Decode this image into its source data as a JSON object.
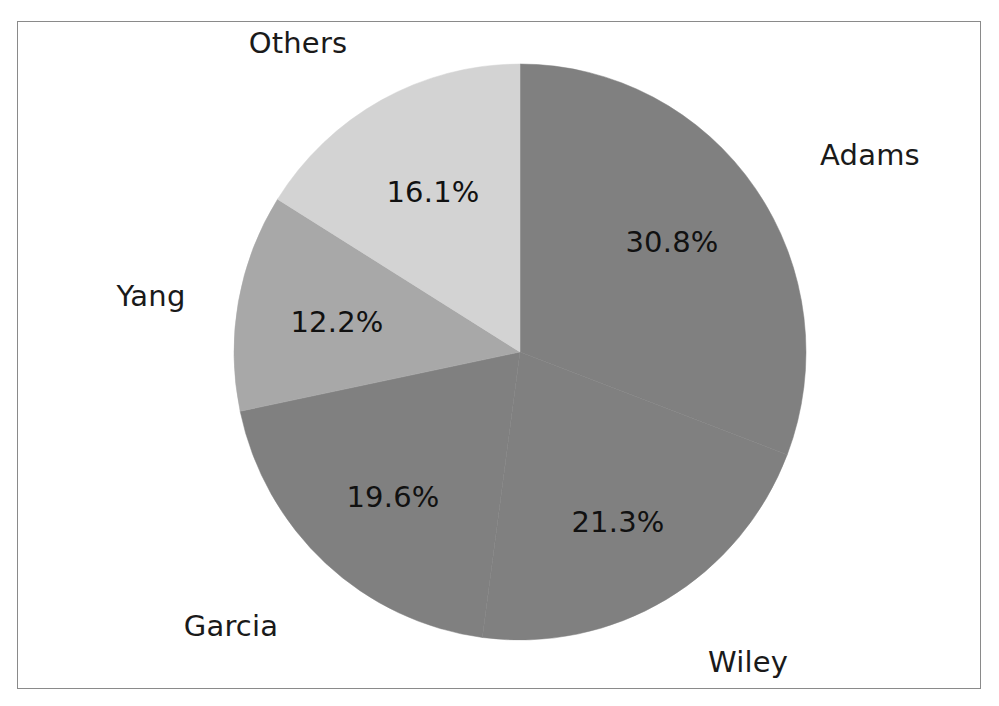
{
  "figure": {
    "background_color": "#ffffff",
    "frame_color": "#8a8a8a",
    "label_color": "#1a1a1a"
  },
  "chart_data": {
    "type": "pie",
    "title": "",
    "xlabel": "",
    "ylabel": "",
    "legend_position": "none",
    "grid": false,
    "start_angle_deg": 90,
    "direction": "clockwise",
    "autopct_format": "%.1f%%",
    "categories": [
      "Adams",
      "Wiley",
      "Garcia",
      "Yang",
      "Others"
    ],
    "values": [
      30.8,
      21.3,
      19.6,
      12.2,
      16.1
    ],
    "labels": [
      "30.8%",
      "21.3%",
      "19.6%",
      "12.2%",
      "16.1%"
    ],
    "colors": [
      "#808080",
      "#808080",
      "#808080",
      "#a8a8a8",
      "#d3d3d3"
    ],
    "slices": [
      {
        "name": "Adams",
        "label": "Adams",
        "value": 30.8,
        "pct_text": "30.8%",
        "color": "#808080",
        "start_deg": 0.0,
        "end_deg": 110.88,
        "label_x": 870,
        "label_y": 155,
        "pct_x": 672,
        "pct_y": 242
      },
      {
        "name": "Wiley",
        "label": "Wiley",
        "value": 21.3,
        "pct_text": "21.3%",
        "color": "#808080",
        "start_deg": 110.88,
        "end_deg": 187.56,
        "label_x": 748,
        "label_y": 662,
        "pct_x": 618,
        "pct_y": 522
      },
      {
        "name": "Garcia",
        "label": "Garcia",
        "value": 19.6,
        "pct_text": "19.6%",
        "color": "#808080",
        "start_deg": 187.56,
        "end_deg": 258.12,
        "label_x": 231,
        "label_y": 626,
        "pct_x": 393,
        "pct_y": 497
      },
      {
        "name": "Yang",
        "label": "Yang",
        "value": 12.2,
        "pct_text": "12.2%",
        "color": "#a8a8a8",
        "start_deg": 258.12,
        "end_deg": 302.04,
        "label_x": 151,
        "label_y": 296,
        "pct_x": 337,
        "pct_y": 322
      },
      {
        "name": "Others",
        "label": "Others",
        "value": 16.1,
        "pct_text": "16.1%",
        "color": "#d3d3d3",
        "start_deg": 302.04,
        "end_deg": 360.0,
        "label_x": 298,
        "label_y": 43,
        "pct_x": 433,
        "pct_y": 192
      }
    ],
    "total": 100.0
  }
}
